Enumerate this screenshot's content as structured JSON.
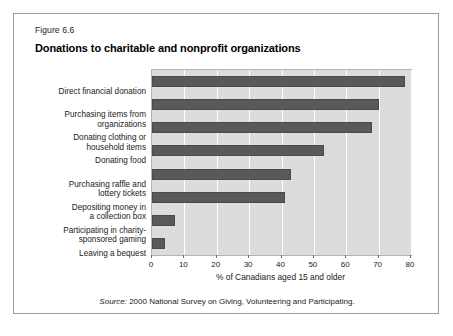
{
  "figure": {
    "number": "Figure 6.6",
    "title": "Donations to charitable and nonprofit organizations",
    "source_keyword": "Source:",
    "source_text": " 2000 National Survey on Giving, Volunteering and Participating."
  },
  "colors": {
    "bar_fill": "#595959",
    "bar_stroke": "#4a4a4a",
    "plot_background": "#dcdcdc",
    "gridline": "#ffffff",
    "frame_border": "#9a9a9a",
    "text": "#1a1a1a"
  },
  "chart_data": {
    "type": "bar",
    "orientation": "horizontal",
    "title": "Donations to charitable and nonprofit organizations",
    "xlabel": "% of Canadians aged 15 and older",
    "ylabel": "",
    "xlim": [
      0,
      80
    ],
    "xticks": [
      0,
      10,
      20,
      30,
      40,
      50,
      60,
      70,
      80
    ],
    "grid": true,
    "legend": false,
    "categories": [
      "Direct financial donation",
      "Purchasing items from\norganizations",
      "Donating clothing or\nhousehold items",
      "Donating food",
      "Purchasing raffle and\nlottery tickets",
      "Depositing money in\na collection box",
      "Participating in charity-\nsponsored gaming",
      "Leaving a bequest"
    ],
    "values": [
      78,
      70,
      68,
      53,
      43,
      41,
      7,
      4
    ]
  }
}
